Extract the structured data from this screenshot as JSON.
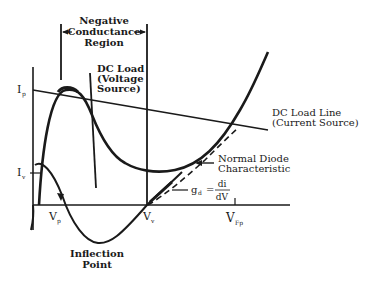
{
  "diagram": {
    "type": "tunnel-diode-iv-characteristic",
    "labels": {
      "region_line1": "Negative",
      "region_line2": "Conductance",
      "region_line3": "Region",
      "dc_load_v_line1": "DC Load",
      "dc_load_v_line2": "(Voltage",
      "dc_load_v_line3": "Source)",
      "dc_load_i_line1": "DC Load Line",
      "dc_load_i_line2": "(Current Source)",
      "normal_diode_line1": "Normal Diode",
      "normal_diode_line2": "Characteristic",
      "gd_symbol": "g",
      "gd_sub": "d",
      "gd_eq": "=",
      "gd_num": "di",
      "gd_den": "dV",
      "inflection_line1": "Inflection",
      "inflection_line2": "Point",
      "ip": "I",
      "ip_sub": "p",
      "iv": "I",
      "iv_sub": "v",
      "vp": "V",
      "vp_sub": "p",
      "vv": "V",
      "vv_sub": "v",
      "vfp": "V",
      "vfp_sub": "Fp"
    },
    "colors": {
      "ink": "#1a1a1a",
      "background": "#ffffff"
    }
  }
}
